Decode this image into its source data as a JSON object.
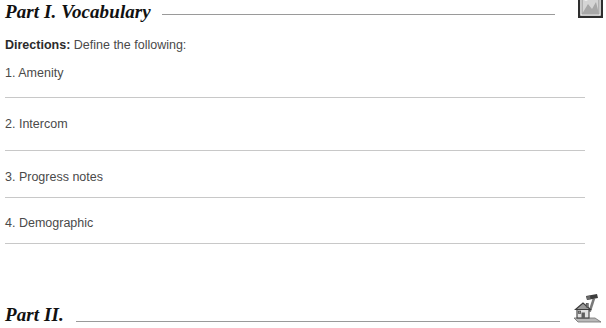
{
  "document": {
    "parts": [
      {
        "title": "Part I. Vocabulary",
        "directions_lead": "Directions:",
        "directions_text": " Define the following:",
        "items": [
          {
            "number": "1.",
            "term": "Amenity"
          },
          {
            "number": "2.",
            "term": "Intercom"
          },
          {
            "number": "3.",
            "term": "Progress notes"
          },
          {
            "number": "4.",
            "term": "Demographic"
          }
        ]
      },
      {
        "title": "Part II."
      }
    ]
  },
  "icons": {
    "top_right": "framed-picture-icon",
    "bottom_right": "house-with-hammer-icon"
  },
  "colors": {
    "page_background": "#ffffff",
    "heading_text": "#111111",
    "body_text": "#4a4a4a",
    "heading_rule": "#9a9a9a",
    "answer_rule": "#c8c8c8"
  }
}
